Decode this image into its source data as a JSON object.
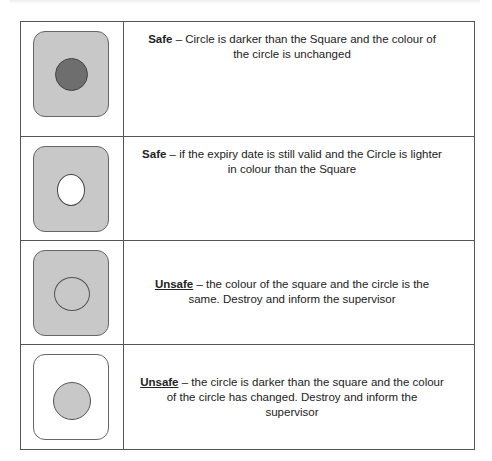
{
  "rows": [
    {
      "label": "Safe",
      "underline": false,
      "text": " – Circle is darker than the Square and the colour of the circle is unchanged",
      "square_color": "#c8c8c8",
      "circle_color": "#6e6e6e",
      "circle_style": "filled-dark"
    },
    {
      "label": "Safe",
      "underline": false,
      "text": " – if the expiry date is still valid and the Circle is lighter in colour than the Square",
      "square_color": "#c8c8c8",
      "circle_color": "#ffffff",
      "circle_style": "white-oval"
    },
    {
      "label": "Unsafe",
      "underline": true,
      "text": " – the colour of the square and the circle is the same. Destroy and inform the supervisor",
      "square_color": "#c8c8c8",
      "circle_color": "#c8c8c8",
      "circle_style": "outline-same"
    },
    {
      "label": "Unsafe",
      "underline": true,
      "text": " – the circle is darker than the square and the colour of the circle has changed. Destroy and inform the supervisor",
      "square_color": "#ffffff",
      "circle_color": "#c8c8c8",
      "circle_style": "filled-light"
    }
  ]
}
